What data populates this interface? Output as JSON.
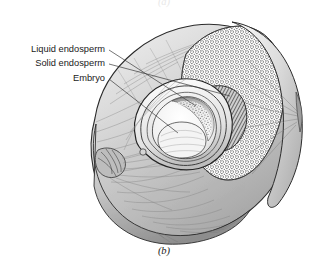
{
  "figure": {
    "caption": "(b)",
    "caption_above_partial": "(a)",
    "background_color": "#ffffff",
    "ink_color": "#1a1a1a"
  },
  "labels": [
    {
      "id": "liquid-endosperm",
      "text": "Liquid endosperm",
      "text_x": 105,
      "text_y": 50,
      "leader_from_x": 109,
      "leader_from_y": 50,
      "leader_to_x": 196,
      "leader_to_y": 106
    },
    {
      "id": "solid-endosperm",
      "text": "Solid endosperm",
      "text_x": 105,
      "text_y": 64,
      "leader_from_x": 109,
      "leader_from_y": 64,
      "leader_to_x": 230,
      "leader_to_y": 96
    },
    {
      "id": "embryo",
      "text": "Embryo",
      "text_x": 105,
      "text_y": 79,
      "leader_from_x": 109,
      "leader_from_y": 79,
      "leader_to_x": 178,
      "leader_to_y": 133
    }
  ],
  "anatomy": {
    "husk_label": "fibrous husk",
    "shell_label": "hard shell",
    "solid_endosperm_label": "solid endosperm (stippled)",
    "cavity_label": "embryo cavity",
    "flap_label": "cut husk flap"
  },
  "colors": {
    "outline": "#2b2b2b",
    "mid_shade": "#9a9a9a",
    "light_shade": "#d8d8d8",
    "dark_shade": "#5a5a5a",
    "stipple": "#3a3a3a",
    "paper": "#ffffff"
  }
}
